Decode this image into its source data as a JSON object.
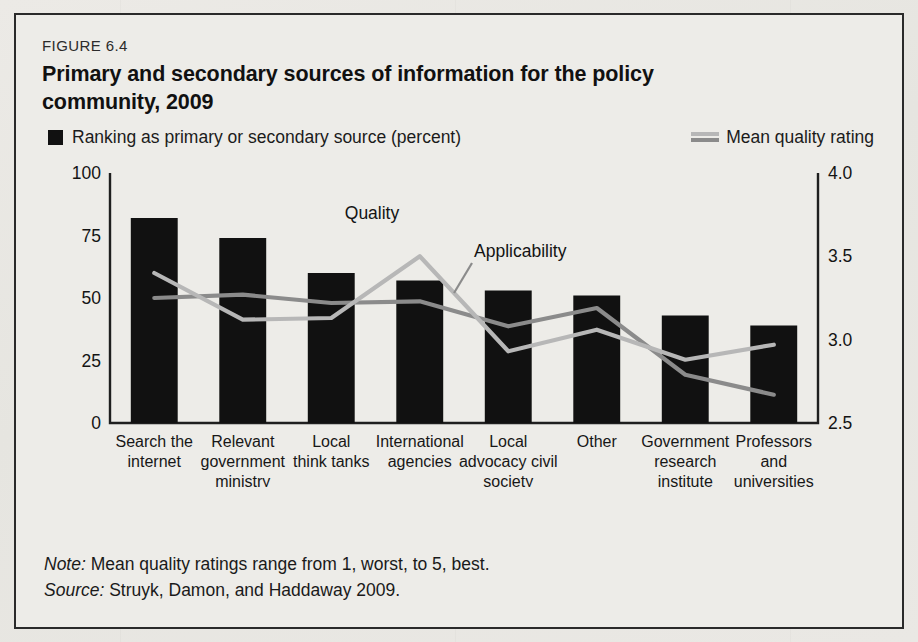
{
  "figure": {
    "number": "FIGURE 6.4",
    "title": "Primary and secondary sources of information for the policy community, 2009"
  },
  "legend": {
    "bar_label": "Ranking as primary or secondary source (percent)",
    "line_label": "Mean quality rating"
  },
  "annotations": {
    "quality": "Quality",
    "applicability": "Applicability"
  },
  "footnotes": {
    "note_prefix": "Note:",
    "note_text": " Mean quality ratings range from 1, worst, to 5, best.",
    "source_prefix": "Source:",
    "source_text": " Struyk, Damon, and Haddaway 2009."
  },
  "colors": {
    "bar": "#111111",
    "quality_line": "#b7b7b7",
    "applicability_line": "#8b8b8b",
    "axis": "#1f1f1f",
    "background": "#edece8"
  },
  "chart_data": {
    "type": "bar",
    "title": "Primary and secondary sources of information for the policy community, 2009",
    "xlabel": "",
    "ylabel": "Ranking as primary or secondary source (percent)",
    "y2label": "Mean quality rating",
    "ylim": [
      0,
      100
    ],
    "y2lim": [
      2.5,
      4.0
    ],
    "yticks": [
      "0",
      "25",
      "50",
      "75",
      "100"
    ],
    "ytick_values": [
      0,
      25,
      50,
      75,
      100
    ],
    "y2ticks": [
      "2.5",
      "3.0",
      "3.5",
      "4.0"
    ],
    "y2tick_values": [
      2.5,
      3.0,
      3.5,
      4.0
    ],
    "grid": false,
    "legend_position": "above-plot",
    "categories": [
      "Search the internet",
      "Relevant government ministry",
      "Local think tanks",
      "International agencies",
      "Local advocacy civil society organizations",
      "Other",
      "Government research institute",
      "Professors and universities"
    ],
    "category_lines": [
      [
        "Search the",
        "internet"
      ],
      [
        "Relevant",
        "government",
        "ministry"
      ],
      [
        "Local",
        "think tanks"
      ],
      [
        "International",
        "agencies"
      ],
      [
        "Local",
        "advocacy civil",
        "society",
        "organizations"
      ],
      [
        "Other"
      ],
      [
        "Government",
        "research",
        "institute"
      ],
      [
        "Professors",
        "and",
        "universities"
      ]
    ],
    "series": [
      {
        "name": "Ranking as primary or secondary source (percent)",
        "type": "bar",
        "axis": "left",
        "values": [
          82,
          74,
          60,
          57,
          53,
          51,
          43,
          39
        ]
      },
      {
        "name": "Quality",
        "type": "line",
        "axis": "right",
        "values": [
          3.4,
          3.12,
          3.13,
          3.5,
          2.93,
          3.06,
          2.88,
          2.97
        ]
      },
      {
        "name": "Applicability",
        "type": "line",
        "axis": "right",
        "values": [
          3.25,
          3.27,
          3.22,
          3.23,
          3.08,
          3.19,
          2.79,
          2.67
        ]
      }
    ]
  }
}
